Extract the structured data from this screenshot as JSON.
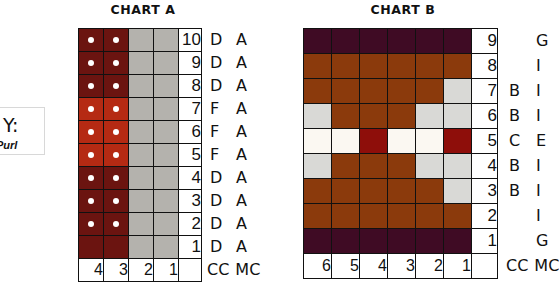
{
  "key": {
    "title": "Y:",
    "subtitle": "Purl"
  },
  "colors": {
    "A_dark": "#6b1410",
    "A_red": "#b52a13",
    "A_gray": "#b4b2ad",
    "B_purple": "#3f0b24",
    "B_brown": "#8b3a0c",
    "B_lightgray": "#d9d9d6",
    "B_cream": "#fbf8f2",
    "B_red": "#8e0e0a"
  },
  "chart_a": {
    "title": "CHART A",
    "rows": [
      {
        "num": "10",
        "cc": "D",
        "mc": "A",
        "cells": [
          "A_dark",
          "A_dark",
          "A_gray",
          "A_gray"
        ],
        "purl": [
          true,
          true,
          false,
          false
        ]
      },
      {
        "num": "9",
        "cc": "D",
        "mc": "A",
        "cells": [
          "A_dark",
          "A_dark",
          "A_gray",
          "A_gray"
        ],
        "purl": [
          true,
          true,
          false,
          false
        ]
      },
      {
        "num": "8",
        "cc": "D",
        "mc": "A",
        "cells": [
          "A_dark",
          "A_dark",
          "A_gray",
          "A_gray"
        ],
        "purl": [
          true,
          true,
          false,
          false
        ]
      },
      {
        "num": "7",
        "cc": "F",
        "mc": "A",
        "cells": [
          "A_red",
          "A_red",
          "A_gray",
          "A_gray"
        ],
        "purl": [
          true,
          true,
          false,
          false
        ]
      },
      {
        "num": "6",
        "cc": "F",
        "mc": "A",
        "cells": [
          "A_red",
          "A_red",
          "A_gray",
          "A_gray"
        ],
        "purl": [
          true,
          true,
          false,
          false
        ]
      },
      {
        "num": "5",
        "cc": "F",
        "mc": "A",
        "cells": [
          "A_red",
          "A_red",
          "A_gray",
          "A_gray"
        ],
        "purl": [
          true,
          true,
          false,
          false
        ]
      },
      {
        "num": "4",
        "cc": "D",
        "mc": "A",
        "cells": [
          "A_dark",
          "A_dark",
          "A_gray",
          "A_gray"
        ],
        "purl": [
          true,
          true,
          false,
          false
        ]
      },
      {
        "num": "3",
        "cc": "D",
        "mc": "A",
        "cells": [
          "A_dark",
          "A_dark",
          "A_gray",
          "A_gray"
        ],
        "purl": [
          true,
          true,
          false,
          false
        ]
      },
      {
        "num": "2",
        "cc": "D",
        "mc": "A",
        "cells": [
          "A_dark",
          "A_dark",
          "A_gray",
          "A_gray"
        ],
        "purl": [
          true,
          true,
          false,
          false
        ]
      },
      {
        "num": "1",
        "cc": "D",
        "mc": "A",
        "cells": [
          "A_dark",
          "A_dark",
          "A_gray",
          "A_gray"
        ],
        "purl": [
          false,
          false,
          false,
          false
        ]
      }
    ],
    "footer": [
      "4",
      "3",
      "2",
      "1",
      ""
    ],
    "footer_cc": "CC",
    "footer_mc": "MC"
  },
  "chart_b": {
    "title": "CHART B",
    "rows": [
      {
        "num": "9",
        "cc": "",
        "mc": "G",
        "cells": [
          "B_purple",
          "B_purple",
          "B_purple",
          "B_purple",
          "B_purple",
          "B_purple"
        ]
      },
      {
        "num": "8",
        "cc": "",
        "mc": "I",
        "cells": [
          "B_brown",
          "B_brown",
          "B_brown",
          "B_brown",
          "B_brown",
          "B_brown"
        ]
      },
      {
        "num": "7",
        "cc": "B",
        "mc": "I",
        "cells": [
          "B_brown",
          "B_brown",
          "B_brown",
          "B_brown",
          "B_brown",
          "B_lightgray"
        ]
      },
      {
        "num": "6",
        "cc": "B",
        "mc": "I",
        "cells": [
          "B_lightgray",
          "B_brown",
          "B_brown",
          "B_brown",
          "B_lightgray",
          "B_lightgray"
        ]
      },
      {
        "num": "5",
        "cc": "C",
        "mc": "E",
        "cells": [
          "B_cream",
          "B_cream",
          "B_red",
          "B_cream",
          "B_cream",
          "B_red"
        ]
      },
      {
        "num": "4",
        "cc": "B",
        "mc": "I",
        "cells": [
          "B_lightgray",
          "B_brown",
          "B_brown",
          "B_brown",
          "B_lightgray",
          "B_lightgray"
        ]
      },
      {
        "num": "3",
        "cc": "B",
        "mc": "I",
        "cells": [
          "B_brown",
          "B_brown",
          "B_brown",
          "B_brown",
          "B_brown",
          "B_lightgray"
        ]
      },
      {
        "num": "2",
        "cc": "",
        "mc": "I",
        "cells": [
          "B_brown",
          "B_brown",
          "B_brown",
          "B_brown",
          "B_brown",
          "B_brown"
        ]
      },
      {
        "num": "1",
        "cc": "",
        "mc": "G",
        "cells": [
          "B_purple",
          "B_purple",
          "B_purple",
          "B_purple",
          "B_purple",
          "B_purple"
        ]
      }
    ],
    "footer": [
      "6",
      "5",
      "4",
      "3",
      "2",
      "1",
      ""
    ],
    "footer_cc": "CC",
    "footer_mc": "MC"
  }
}
